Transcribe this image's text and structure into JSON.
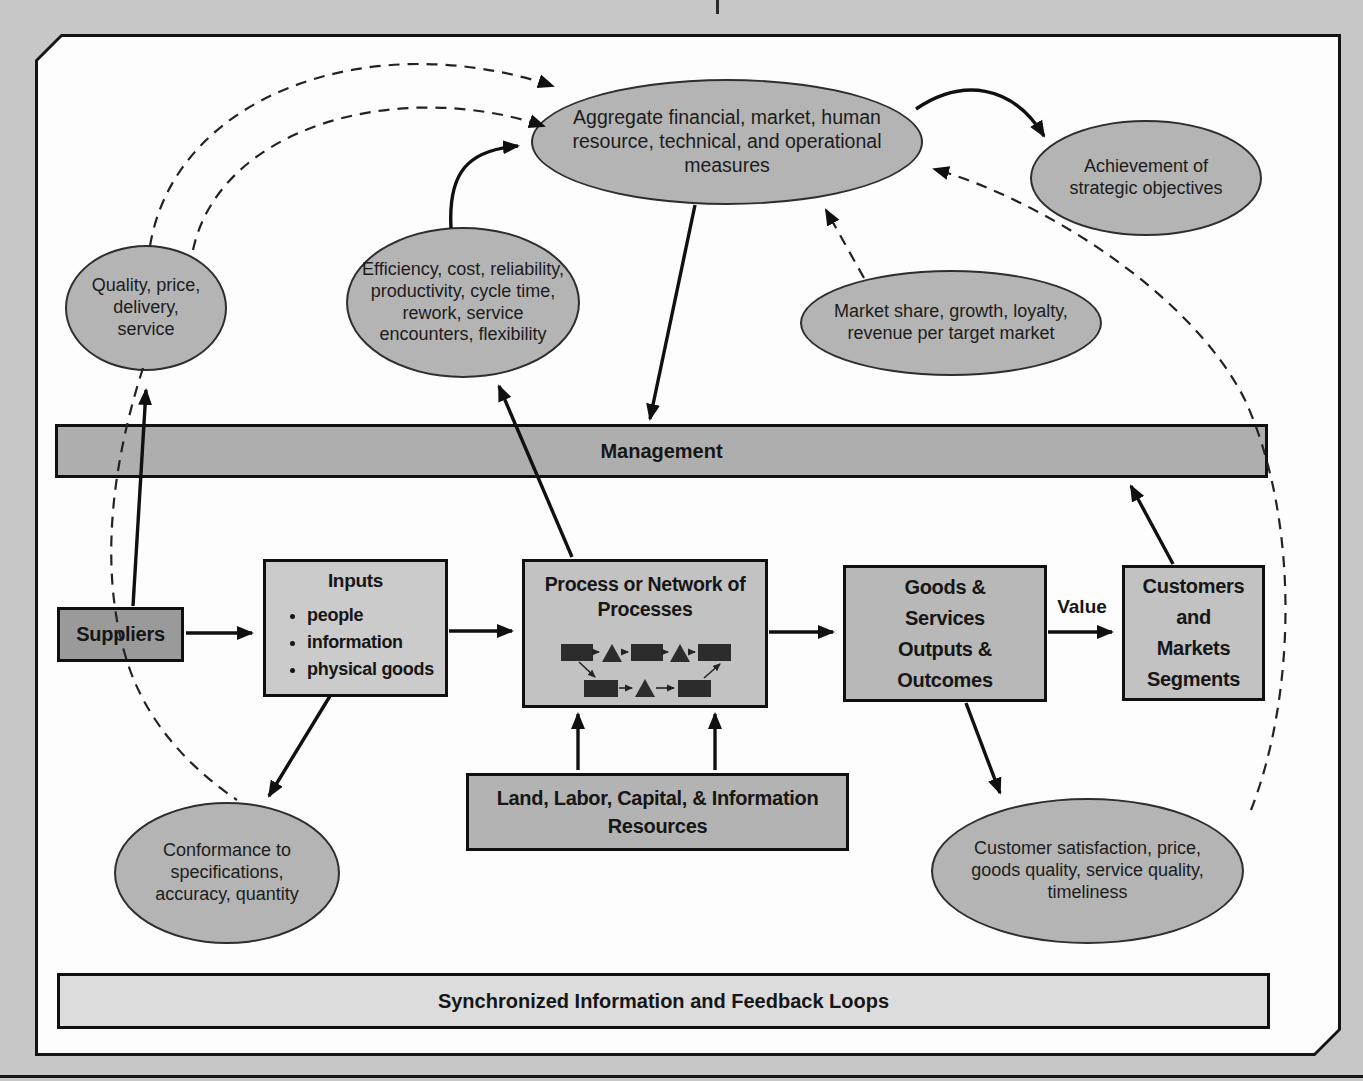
{
  "colors": {
    "page_bg": "#c7c7c7",
    "panel_bg": "#fdfdfd",
    "ellipse_fill": "#b4b4b4",
    "management_fill": "#aeaeae",
    "suppliers_fill": "#9a9a9a",
    "inputs_fill": "#cbcbcb",
    "process_fill": "#c2c2c2",
    "goods_fill": "#b8b8b8",
    "customers_fill": "#c2c2c2",
    "resources_fill": "#b3b3b3",
    "feedback_fill": "#dcdcdc",
    "line": "#101010"
  },
  "nodes": {
    "aggregate": "Aggregate financial, market, human resource, technical, and operational measures",
    "achievement": "Achievement of strategic objectives",
    "quality": "Quality, price, delivery, service",
    "efficiency": "Efficiency, cost, reliability, productivity, cycle time, rework, service encounters, flexibility",
    "market_share": "Market share, growth, loyalty, revenue per target market",
    "management": "Management",
    "suppliers": "Suppliers",
    "inputs": {
      "title": "Inputs",
      "items": [
        "people",
        "information",
        "physical goods"
      ]
    },
    "process": "Process or Network of Processes",
    "goods": "Goods & Services Outputs & Outcomes",
    "value": "Value",
    "customers": "Customers and Markets Segments",
    "resources": "Land, Labor, Capital, & Information Resources",
    "conformance": "Conformance to specifications, accuracy, quantity",
    "customer_satisfaction": "Customer satisfaction, price, goods quality, service quality, timeliness",
    "feedback": "Synchronized Information and Feedback Loops"
  }
}
